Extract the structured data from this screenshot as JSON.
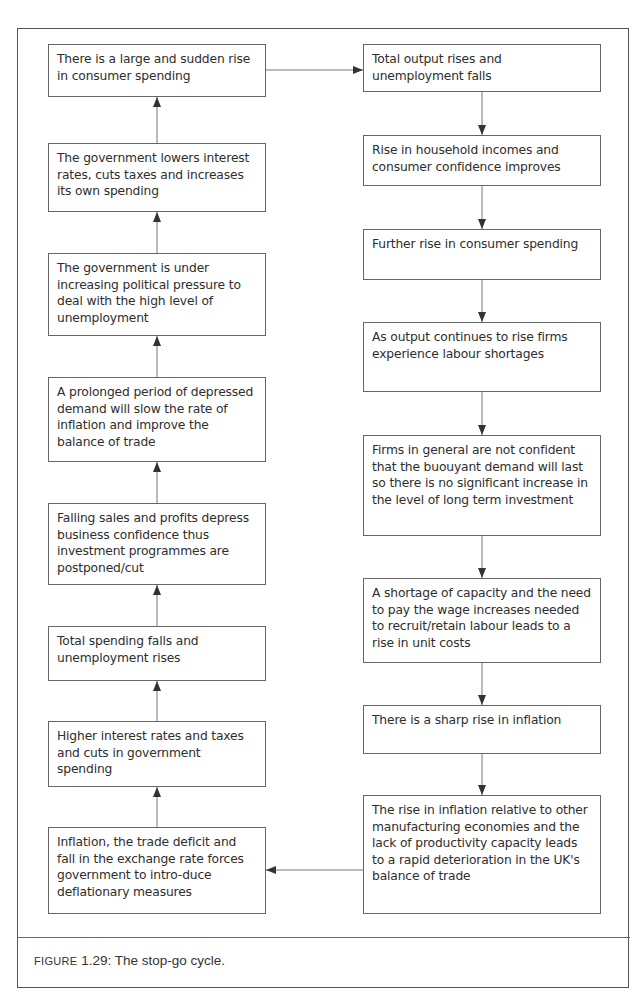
{
  "figure": {
    "caption_prefix": "Figure",
    "caption_number": "1.29:",
    "caption_text": "The stop-go cycle."
  },
  "left_column": [
    {
      "id": "L1",
      "text": "There is a large and sudden rise in consumer spending"
    },
    {
      "id": "L2",
      "text": "The government lowers interest rates, cuts taxes and increases its own spending"
    },
    {
      "id": "L3",
      "text": "The government is under increasing political pressure to deal with the high level of unemployment"
    },
    {
      "id": "L4",
      "text": "A prolonged period of depressed demand will slow the rate of inflation and improve the balance of trade"
    },
    {
      "id": "L5",
      "text": "Falling sales and profits depress business confidence thus investment programmes are postponed/cut"
    },
    {
      "id": "L6",
      "text": "Total spending falls and unemployment rises"
    },
    {
      "id": "L7",
      "text": "Higher interest rates and taxes and cuts in government spending"
    },
    {
      "id": "L8",
      "text": "Inflation, the trade deficit and fall in the exchange rate forces government to intro-duce deflationary measures"
    }
  ],
  "right_column": [
    {
      "id": "R1",
      "text": "Total output rises and unemployment falls"
    },
    {
      "id": "R2",
      "text": "Rise in household incomes and consumer confidence improves"
    },
    {
      "id": "R3",
      "text": "Further rise in consumer spending"
    },
    {
      "id": "R4",
      "text": "As output continues to rise firms experience labour shortages"
    },
    {
      "id": "R5",
      "text": "Firms in general are not confident that the buouyant demand will last so there is no significant increase in the level of long term investment"
    },
    {
      "id": "R6",
      "text": "A shortage of capacity and the need to pay the wage increases needed to recruit/retain labour leads to a rise in unit costs"
    },
    {
      "id": "R7",
      "text": "There is a sharp rise in inflation"
    },
    {
      "id": "R8",
      "text": "The rise in inflation relative to other manufacturing economies and the lack of productivity capacity leads to a rapid deterioration in the UK's balance of trade"
    }
  ],
  "flow": [
    [
      "L1",
      "R1"
    ],
    [
      "R1",
      "R2"
    ],
    [
      "R2",
      "R3"
    ],
    [
      "R3",
      "R4"
    ],
    [
      "R4",
      "R5"
    ],
    [
      "R5",
      "R6"
    ],
    [
      "R6",
      "R7"
    ],
    [
      "R7",
      "R8"
    ],
    [
      "R8",
      "L8"
    ],
    [
      "L8",
      "L7"
    ],
    [
      "L7",
      "L6"
    ],
    [
      "L6",
      "L5"
    ],
    [
      "L5",
      "L4"
    ],
    [
      "L4",
      "L3"
    ],
    [
      "L3",
      "L2"
    ],
    [
      "L2",
      "L1"
    ]
  ],
  "colors": {
    "line": "#666666",
    "text": "#2e2e2e",
    "background": "#ffffff"
  }
}
